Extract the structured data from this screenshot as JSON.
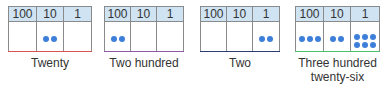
{
  "colors": {
    "header_bg": "#cfe3f3",
    "dot": "#3d7fd9",
    "grid": "#8a8a8a"
  },
  "headers": [
    "100",
    "10",
    "1"
  ],
  "charts": [
    {
      "label_lines": [
        "Twenty"
      ],
      "counts": {
        "hundreds": 0,
        "tens": 2,
        "ones": 0
      },
      "bottom_color": "#d9534f"
    },
    {
      "label_lines": [
        "Two hundred"
      ],
      "counts": {
        "hundreds": 2,
        "tens": 0,
        "ones": 0
      },
      "bottom_color": "#8e5aa8"
    },
    {
      "label_lines": [
        "Two"
      ],
      "counts": {
        "hundreds": 0,
        "tens": 0,
        "ones": 2
      },
      "bottom_color": "#2c3e70"
    },
    {
      "label_lines": [
        "Three hundred",
        "twenty-six"
      ],
      "counts": {
        "hundreds": 3,
        "tens": 2,
        "ones": 6
      },
      "bottom_color": "#4cbf6a"
    }
  ]
}
